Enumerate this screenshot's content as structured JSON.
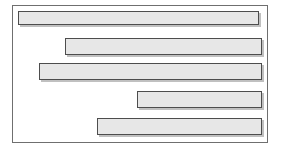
{
  "diagram": {
    "type": "horizontal-bar-schedule",
    "title": "",
    "frame": {
      "x": 12,
      "y": 5,
      "width": 256,
      "height": 138,
      "border_color": "#6f6f6f",
      "background": "#ffffff"
    },
    "style": {
      "bar_fill": "#e7e7e7",
      "bar_border": "#4d4d4d",
      "bar_shadow": "#8c8c8c"
    },
    "bars": [
      {
        "label": "",
        "x": 18,
        "y": 11,
        "width": 241,
        "height": 14
      },
      {
        "label": "",
        "x": 65,
        "y": 38,
        "width": 197,
        "height": 17
      },
      {
        "label": "",
        "x": 39,
        "y": 63,
        "width": 223,
        "height": 17
      },
      {
        "label": "",
        "x": 137,
        "y": 91,
        "width": 125,
        "height": 17
      },
      {
        "label": "",
        "x": 97,
        "y": 118,
        "width": 165,
        "height": 17
      }
    ]
  },
  "chart_data": {
    "type": "bar",
    "orientation": "horizontal",
    "title": "",
    "xlabel": "",
    "ylabel": "",
    "categories": [
      "1",
      "2",
      "3",
      "4",
      "5"
    ],
    "series": [
      {
        "name": "span",
        "start": [
          2,
          21,
          11,
          49,
          33
        ],
        "end": [
          97,
          98,
          98,
          98,
          98
        ]
      }
    ],
    "xlim": [
      0,
      100
    ],
    "grid": false,
    "legend": null
  }
}
